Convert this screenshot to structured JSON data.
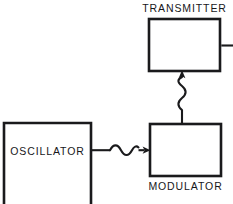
{
  "diagram": {
    "background_color": "#ffffff",
    "line_color": "#1a1a1c",
    "blocks": [
      {
        "id": "transmitter",
        "label": "TRANSMITTER",
        "label_position": "above",
        "x": 149,
        "y": 19,
        "width": 71,
        "height": 52
      },
      {
        "id": "modulator",
        "label": "MODULATOR",
        "label_position": "below",
        "x": 150,
        "y": 124,
        "width": 71,
        "height": 52
      },
      {
        "id": "oscillator",
        "label": "OSCILLATOR",
        "label_position": "inside",
        "x": 4,
        "y": 123,
        "width": 87,
        "height": 81
      }
    ],
    "connections": [
      {
        "id": "oscillator-to-modulator",
        "from": "oscillator",
        "to": "modulator",
        "orientation": "horizontal",
        "style": "wavy-arrow",
        "arrowhead": "right",
        "wave_cycles": 1.5
      },
      {
        "id": "modulator-to-transmitter",
        "from": "modulator",
        "to": "transmitter",
        "orientation": "vertical",
        "style": "wavy-arrow",
        "arrowhead": "up",
        "wave_cycles": 3
      },
      {
        "id": "transmitter-output",
        "from": "transmitter",
        "to": "antenna-offscreen",
        "orientation": "horizontal",
        "style": "plain-line",
        "arrowhead": "none"
      }
    ]
  }
}
